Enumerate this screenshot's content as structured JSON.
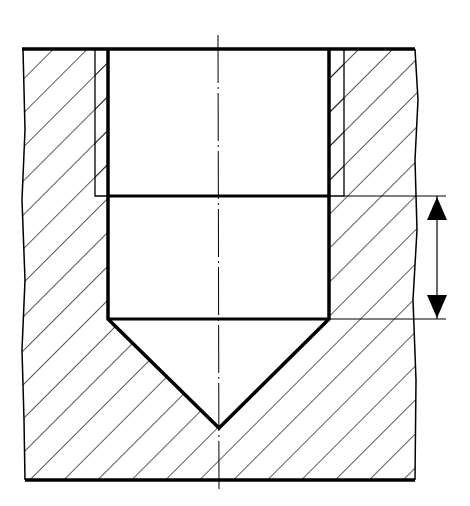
{
  "diagram": {
    "type": "technical-section-drawing",
    "colors": {
      "line": "#000000",
      "background": "#ffffff"
    },
    "features": {
      "part_section": "hatched material",
      "thread_outer_diameter": "thin lines at thread root",
      "core_bore": "thick lines",
      "drill_point": "conical tip",
      "centerline": "dash-dot vertical axis",
      "dimension": "vertical dimension with two arrows marking thread-free bore depth"
    },
    "labels": []
  }
}
